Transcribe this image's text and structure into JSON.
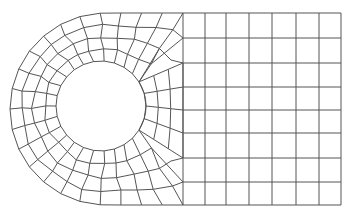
{
  "figure": {
    "title": "",
    "stroke_color": "#555555",
    "background": "#ffffff"
  },
  "geometry": {
    "outer": {
      "cx": 106,
      "cy": 109,
      "r": 96,
      "top_y": 13,
      "bottom_y": 205,
      "right_x": 341
    },
    "hole": {
      "cx": 101,
      "cy": 106,
      "r": 45
    },
    "right_grid": {
      "x": [
        183,
        205,
        226,
        249,
        272,
        296,
        319,
        341
      ],
      "y": [
        13,
        38,
        63,
        87,
        110,
        133,
        158,
        182,
        205
      ]
    }
  }
}
